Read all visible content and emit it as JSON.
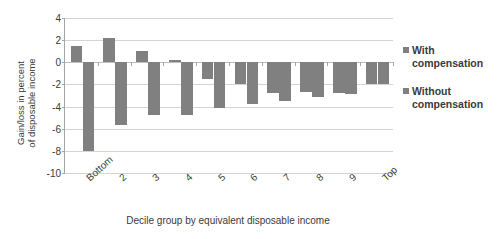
{
  "chart_data": {
    "type": "bar",
    "title": "",
    "subtitle": "",
    "xlabel": "Decile group by equivalent disposable income",
    "ylabel": "Gain/loss in percent of disposable income",
    "ylabel_lines": [
      "Gain/loss in percent",
      "of disposable income"
    ],
    "categories": [
      "Bottom",
      "2",
      "3",
      "4",
      "5",
      "6",
      "7",
      "8",
      "9",
      "Top"
    ],
    "series": [
      {
        "name": "With compensation",
        "values": [
          1.5,
          2.2,
          1.0,
          0.25,
          -1.5,
          -2.0,
          -2.8,
          -2.7,
          -2.8,
          -2.0
        ]
      },
      {
        "name": "Without compensation",
        "values": [
          -8.0,
          -5.7,
          -4.8,
          -4.8,
          -4.1,
          -3.75,
          -3.5,
          -3.1,
          -2.9,
          -2.0
        ]
      }
    ],
    "ylim": [
      -10,
      4
    ],
    "yticks": [
      4,
      2,
      0,
      -2,
      -4,
      -6,
      -8,
      -10
    ],
    "ytick_labels": [
      "4",
      "2",
      "0",
      "-2",
      "-4",
      "-6",
      "-8",
      "-10"
    ],
    "grid": true,
    "grid_axis": "y",
    "legend_position": "right",
    "bar_color": "#808080",
    "grid_color": "#d4d4d4",
    "axis_color": "#a6a6a6",
    "text_color": "#3a3a3a",
    "background": "#ffffff"
  },
  "legend": {
    "items": [
      {
        "label_line1": "With",
        "label_line2": "compensation",
        "color": "#808080"
      },
      {
        "label_line1": "Without",
        "label_line2": "compensation",
        "color": "#808080"
      }
    ]
  }
}
